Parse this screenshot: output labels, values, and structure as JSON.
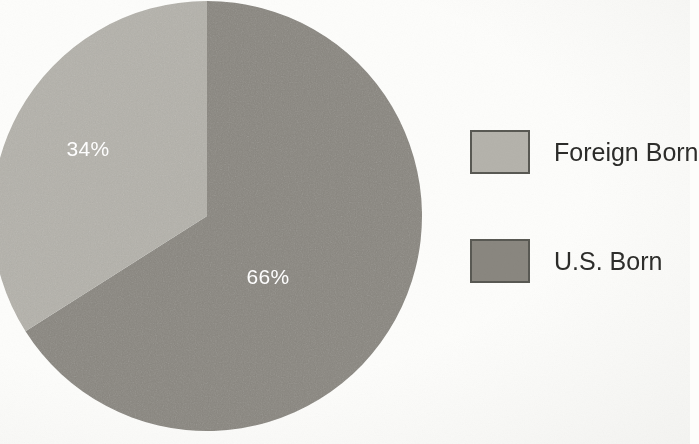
{
  "background_color": "#fdfdfb",
  "chart_data": {
    "type": "pie",
    "title": "",
    "subtitle": "",
    "xlabel": "",
    "ylabel": "",
    "grid": false,
    "legend_position": "right",
    "start_angle_deg": 0,
    "direction": "clockwise",
    "categories": [
      "U.S. Born",
      "Foreign Born"
    ],
    "values": [
      66,
      34
    ],
    "value_unit": "percent",
    "data_labels": [
      "66%",
      "34%"
    ],
    "colors": [
      "#8a8780",
      "#b5b3ac"
    ],
    "slices": [
      {
        "name": "U.S. Born",
        "value": 66,
        "label": "66%",
        "color": "#8a8780",
        "label_color": "#ffffff",
        "label_x": 268,
        "label_y": 278,
        "start_deg": 0,
        "end_deg": 237.6
      },
      {
        "name": "Foreign Born",
        "value": 34,
        "label": "34%",
        "color": "#b5b3ac",
        "label_color": "#ffffff",
        "label_x": 88,
        "label_y": 150,
        "start_deg": 237.6,
        "end_deg": 360
      }
    ],
    "geometry": {
      "center_x": 207,
      "center_y": 216,
      "radius": 215
    },
    "legend": [
      {
        "label": "Foreign Born",
        "color": "#b5b3ac",
        "border_color": "#595953"
      },
      {
        "label": "U.S. Born",
        "color": "#8a8780",
        "border_color": "#595953"
      }
    ]
  }
}
